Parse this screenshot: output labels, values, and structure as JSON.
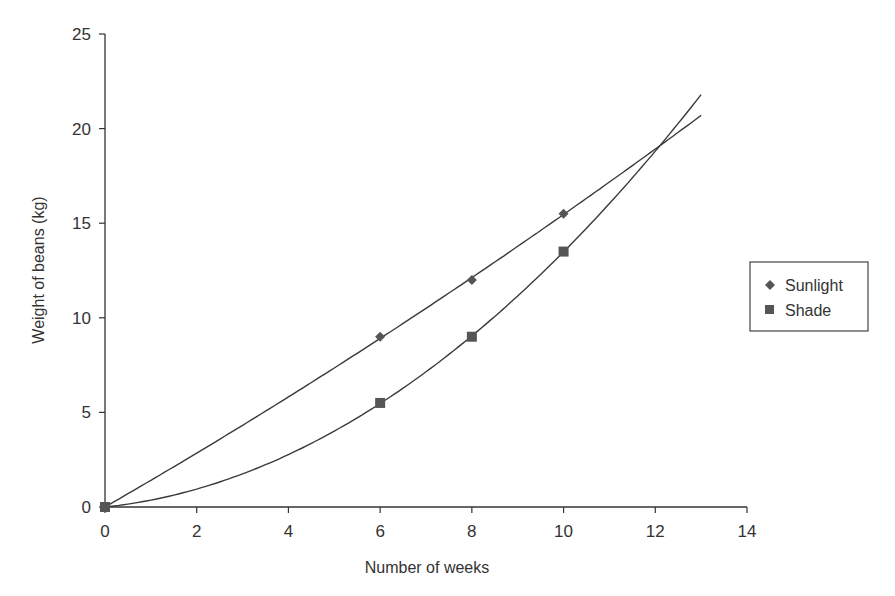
{
  "chart_data": {
    "type": "scatter",
    "title": "",
    "xlabel": "Number of weeks",
    "ylabel": "Weight of beans (kg)",
    "xlim": [
      0,
      14
    ],
    "ylim": [
      0,
      25
    ],
    "xticks": [
      0,
      2,
      4,
      6,
      8,
      10,
      12,
      14
    ],
    "yticks": [
      0,
      5,
      10,
      15,
      20,
      25
    ],
    "grid": false,
    "legend_position": "right",
    "series": [
      {
        "name": "Sunlight",
        "marker": "diamond",
        "x": [
          0,
          6,
          8,
          10
        ],
        "y": [
          0,
          9,
          12,
          15.5
        ],
        "trendline": "polynomial",
        "trendline_end": [
          13,
          20.7
        ]
      },
      {
        "name": "Shade",
        "marker": "square",
        "x": [
          0,
          6,
          8,
          10
        ],
        "y": [
          0,
          5.5,
          9,
          13.5
        ],
        "trendline": "polynomial",
        "trendline_end": [
          13,
          21.8
        ]
      }
    ],
    "annotations": [
      "Trendlines cross at approximately 12 weeks, 19 kg"
    ]
  },
  "legend": {
    "items": [
      {
        "label": "Sunlight",
        "marker": "diamond-icon"
      },
      {
        "label": "Shade",
        "marker": "square-icon"
      }
    ]
  },
  "colors": {
    "line": "#3a3a3a",
    "marker": "#555555",
    "axis": "#333333"
  }
}
